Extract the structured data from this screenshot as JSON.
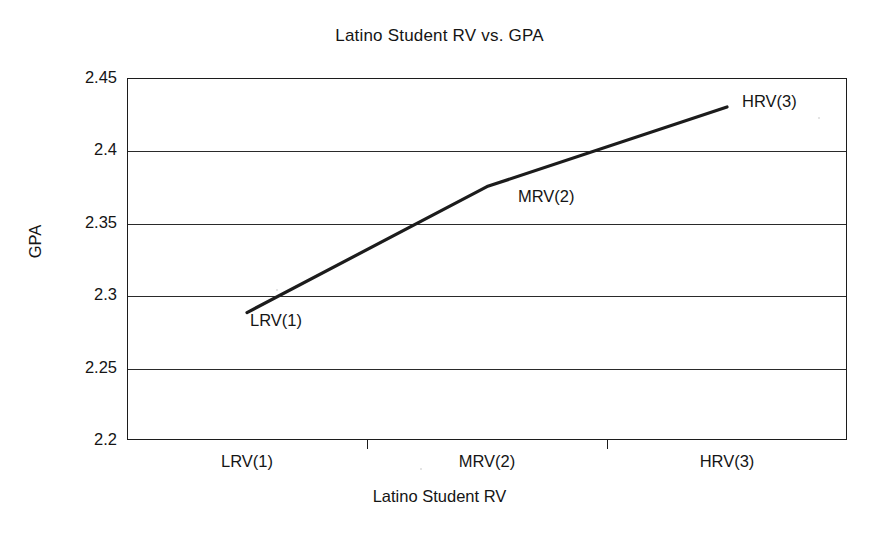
{
  "chart_data": {
    "type": "line",
    "title": "Latino Student RV vs. GPA",
    "xlabel": "Latino Student RV",
    "ylabel": "GPA",
    "categories": [
      "LRV(1)",
      "MRV(2)",
      "HRV(3)"
    ],
    "values": [
      2.288,
      2.375,
      2.43
    ],
    "point_labels": [
      "LRV(1)",
      "MRV(2)",
      "HRV(3)"
    ],
    "ylim": [
      2.2,
      2.45
    ],
    "ytick_labels": [
      "2.45",
      "2.4",
      "2.35",
      "2.3",
      "2.25",
      "2.2"
    ],
    "ytick_values": [
      2.45,
      2.4,
      2.35,
      2.3,
      2.25,
      2.2
    ],
    "xtick_labels": [
      "LRV(1)",
      "MRV(2)",
      "HRV(3)"
    ],
    "grid": "horizontal",
    "legend": "none",
    "series": [
      {
        "name": "GPA",
        "values": [
          2.288,
          2.375,
          2.43
        ],
        "color": "#1c1c1c"
      }
    ],
    "colors": {
      "line": "#1c1c1c",
      "axis": "#1c1c1c",
      "grid": "#2a2a2a",
      "text": "#151515",
      "background": "#ffffff"
    }
  }
}
